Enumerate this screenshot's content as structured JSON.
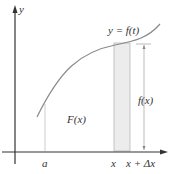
{
  "diagram": {
    "axes": {
      "x_label": "x",
      "y_label": "y"
    },
    "curve_label": "y = f(t)",
    "area_label": "F(x)",
    "height_label": "f(x)",
    "x_ticks": {
      "a": "a",
      "x": "x",
      "x_plus_dx": "x + Δx"
    },
    "caption_fragment": "",
    "colors": {
      "curve": "#8a8a8a",
      "axis": "#333333",
      "strip": "#ececec",
      "lines": "#b0b0b0"
    }
  }
}
